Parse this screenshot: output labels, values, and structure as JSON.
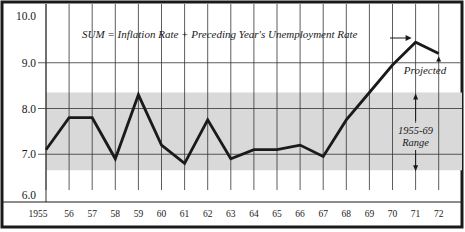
{
  "chart_data": {
    "type": "line",
    "title": "SUM = Inflation Rate + Preceding Year's Unemployment Rate",
    "xlabel": "",
    "ylabel": "",
    "categories": [
      "1955",
      "56",
      "57",
      "58",
      "59",
      "60",
      "61",
      "62",
      "63",
      "64",
      "65",
      "66",
      "67",
      "68",
      "69",
      "70",
      "71",
      "72"
    ],
    "series": [
      {
        "name": "SUM = Inflation Rate + Preceding Year's Unemployment Rate",
        "values": [
          7.1,
          7.8,
          7.8,
          6.9,
          8.3,
          7.2,
          6.8,
          7.75,
          6.9,
          7.1,
          7.1,
          7.2,
          6.95,
          7.75,
          8.35,
          8.95,
          9.45,
          9.2
        ]
      }
    ],
    "yticks": [
      "6.0",
      "7.0",
      "8.0",
      "9.0",
      "10.0"
    ],
    "ylim": [
      6.0,
      10.0
    ],
    "grid": true,
    "shaded_band": {
      "label_line1": "1955-69",
      "label_line2": "Range",
      "ymin": 6.65,
      "ymax": 8.35,
      "color": "#d9d9d9"
    },
    "annotations": [
      {
        "text": "Projected",
        "points_to": "72"
      },
      {
        "text": "1955-69 Range",
        "spans": [
          6.65,
          8.35
        ]
      }
    ],
    "legend": "none",
    "colors": {
      "line": "#1a1a1a",
      "band": "#d9d9d9",
      "grid": "#333333",
      "border": "#1a1a1a"
    }
  }
}
